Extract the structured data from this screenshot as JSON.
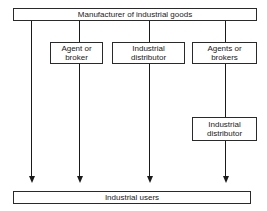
{
  "diagram": {
    "type": "flow",
    "top": {
      "label": "Manufacturer of industrial goods"
    },
    "intermediaries": [
      {
        "label": "Agent or\nbroker"
      },
      {
        "label": "Industrial\ndistributor"
      },
      {
        "label": "Agents or\nbrokers"
      }
    ],
    "secondary": {
      "label": "Industrial\ndistributor"
    },
    "bottom": {
      "label": "Industrial users"
    },
    "channels": [
      {
        "path": [
          "Manufacturer of industrial goods",
          "Industrial users"
        ]
      },
      {
        "path": [
          "Manufacturer of industrial goods",
          "Agent or broker",
          "Industrial users"
        ]
      },
      {
        "path": [
          "Manufacturer of industrial goods",
          "Industrial distributor",
          "Industrial users"
        ]
      },
      {
        "path": [
          "Manufacturer of industrial goods",
          "Agents or brokers",
          "Industrial distributor",
          "Industrial users"
        ]
      }
    ]
  }
}
